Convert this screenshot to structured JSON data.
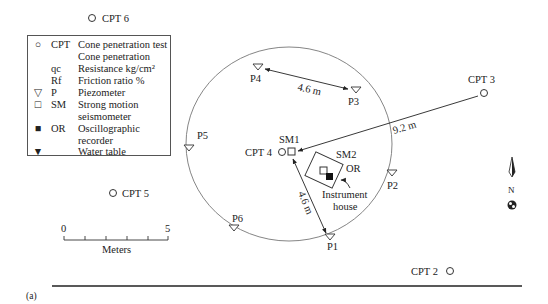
{
  "figure": {
    "panel_label": "(a)",
    "legend": {
      "rows": [
        {
          "symbol": "open-circle",
          "code": "CPT",
          "desc": "Cone penetration test"
        },
        {
          "symbol": "",
          "code": "",
          "desc": "Cone penetration"
        },
        {
          "symbol": "",
          "code": "qc",
          "desc": "Resistance kg/cm²"
        },
        {
          "symbol": "",
          "code": "Rf",
          "desc": "Friction ratio %"
        },
        {
          "symbol": "open-triangle-down",
          "code": "P",
          "desc": "Piezometer"
        },
        {
          "symbol": "open-square",
          "code": "SM",
          "desc": "Strong motion"
        },
        {
          "symbol": "",
          "code": "",
          "desc": "seismometer"
        },
        {
          "symbol": "filled-square",
          "code": "OR",
          "desc": "Oscillographic"
        },
        {
          "symbol": "",
          "code": "",
          "desc": "recorder"
        },
        {
          "symbol": "water-table",
          "code": "",
          "desc": "Water table"
        }
      ]
    },
    "cpts": [
      {
        "label": "CPT 6",
        "x": 92,
        "y": 18
      },
      {
        "label": "CPT 3",
        "x": 482,
        "y": 91
      },
      {
        "label": "CPT 4",
        "x": 282,
        "y": 152
      },
      {
        "label": "CPT 5",
        "x": 115,
        "y": 192
      },
      {
        "label": "CPT 2",
        "x": 450,
        "y": 271
      }
    ],
    "piezometers": [
      {
        "label": "P4",
        "x": 258,
        "y": 67
      },
      {
        "label": "P3",
        "x": 356,
        "y": 89
      },
      {
        "label": "P5",
        "x": 191,
        "y": 147
      },
      {
        "label": "P2",
        "x": 391,
        "y": 171
      },
      {
        "label": "P6",
        "x": 233,
        "y": 230
      },
      {
        "label": "P1",
        "x": 330,
        "y": 237
      }
    ],
    "seismometers": [
      {
        "label": "SM1",
        "x": 292,
        "y": 152
      },
      {
        "label": "SM2",
        "x": 325,
        "y": 170
      }
    ],
    "recorder_label": "OR",
    "instrument_house_label": [
      "Instrument",
      "house"
    ],
    "dimensions": [
      {
        "label": "4.6 m",
        "from": "P4",
        "to": "P3"
      },
      {
        "label": "9.2 m",
        "from": "CPT 3",
        "to": "SM1"
      },
      {
        "label": "4.6 m",
        "from": "SM1",
        "to": "P1"
      }
    ],
    "scale_bar": {
      "start": "0",
      "end": "5",
      "unit": "Meters"
    },
    "north_label": "N"
  }
}
